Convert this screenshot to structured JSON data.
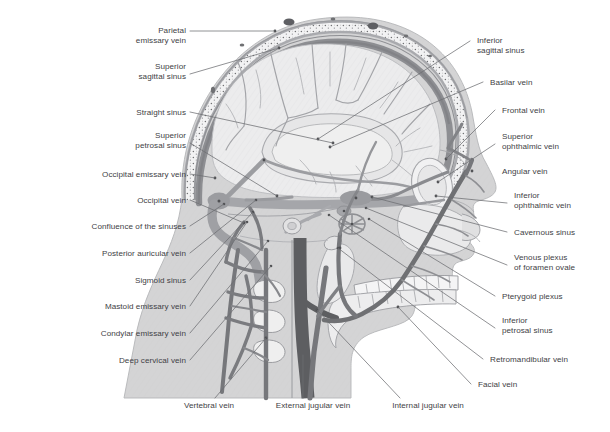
{
  "figure": {
    "view": "right lateral, midsagittal section of head and neck",
    "style": "grayscale medical atlas illustration",
    "colors": {
      "background": "#ffffff",
      "skin_silhouette": "#d2d2d2",
      "bone_light": "#efefef",
      "bone_mid": "#dcdcdc",
      "brain_fill": "#ececed",
      "vein_dark": "#6f7073",
      "vein_mid": "#9a9b9f",
      "vein_light": "#b9babd",
      "jugular_dark": "#5d5e61",
      "leader_line": "#6c6d71",
      "label_text": "#414145",
      "outline": "#8b8c90"
    }
  },
  "labels_left": [
    {
      "id": "parietal-emissary-vein",
      "text": "Parietal\nemissary vein",
      "x": 98,
      "y": 26,
      "w": 88,
      "lx": 190,
      "ly": 31,
      "tx": 275,
      "ty": 31
    },
    {
      "id": "superior-sagittal-sinus",
      "text": "Superior\nsagittal sinus",
      "x": 85,
      "y": 62,
      "w": 101,
      "lx": 190,
      "ly": 74,
      "tx": 279,
      "ty": 48
    },
    {
      "id": "straight-sinus",
      "text": "Straight sinus",
      "x": 75,
      "y": 108,
      "w": 111,
      "lx": 190,
      "ly": 112,
      "tx": 333,
      "ty": 143
    },
    {
      "id": "superior-petrosal-sinus",
      "text": "Superior\npetrosal sinus",
      "x": 85,
      "y": 131,
      "w": 101,
      "lx": 190,
      "ly": 143,
      "tx": 277,
      "ty": 196
    },
    {
      "id": "occipital-emissary-vein",
      "text": "Occipital emissary vein",
      "x": 30,
      "y": 170,
      "w": 156,
      "lx": 190,
      "ly": 174,
      "tx": 215,
      "ty": 178
    },
    {
      "id": "occipital-vein",
      "text": "Occipital vein",
      "x": 75,
      "y": 196,
      "w": 111,
      "lx": 190,
      "ly": 200,
      "tx": 244,
      "ty": 223
    },
    {
      "id": "confluence-of-the-sinuses",
      "text": "Confluence of the sinuses",
      "x": 15,
      "y": 222,
      "w": 171,
      "lx": 190,
      "ly": 226,
      "tx": 224,
      "ty": 204
    },
    {
      "id": "posterior-auricular-vein",
      "text": "Posterior auricular vein",
      "x": 28,
      "y": 249,
      "w": 158,
      "lx": 190,
      "ly": 253,
      "tx": 256,
      "ty": 200
    },
    {
      "id": "sigmoid-sinus",
      "text": "Sigmoid sinus",
      "x": 75,
      "y": 276,
      "w": 111,
      "lx": 190,
      "ly": 280,
      "tx": 253,
      "ty": 212
    },
    {
      "id": "mastoid-emissary-vein",
      "text": "Mastoid emissary vein",
      "x": 35,
      "y": 302,
      "w": 151,
      "lx": 190,
      "ly": 306,
      "tx": 247,
      "ty": 222
    },
    {
      "id": "condylar-emissary-vein",
      "text": "Condylar emissary vein",
      "x": 30,
      "y": 329,
      "w": 156,
      "lx": 190,
      "ly": 333,
      "tx": 268,
      "ty": 241
    },
    {
      "id": "deep-cervical-vein",
      "text": "Deep cervical vein",
      "x": 55,
      "y": 356,
      "w": 131,
      "lx": 190,
      "ly": 360,
      "tx": 271,
      "ty": 266
    }
  ],
  "labels_right": [
    {
      "id": "inferior-sagittal-sinus",
      "text": "Inferior\nsagittal sinus",
      "x": 477,
      "y": 36,
      "lx": 470,
      "ly": 41,
      "tx": 318,
      "ty": 139
    },
    {
      "id": "basilar-vein",
      "text": "Basilar vein",
      "x": 490,
      "y": 78,
      "lx": 483,
      "ly": 82,
      "tx": 330,
      "ty": 147
    },
    {
      "id": "frontal-vein",
      "text": "Frontal vein",
      "x": 502,
      "y": 106,
      "lx": 495,
      "ly": 110,
      "tx": 446,
      "ty": 159
    },
    {
      "id": "superior-ophthalmic-vein",
      "text": "Superior\nophthalmic vein",
      "x": 502,
      "y": 132,
      "lx": 495,
      "ly": 144,
      "tx": 438,
      "ty": 182
    },
    {
      "id": "angular-vein",
      "text": "Angular vein",
      "x": 502,
      "y": 167,
      "lx": 472,
      "ly": 171,
      "tx": 472,
      "ty": 171
    },
    {
      "id": "inferior-ophthalmic-vein",
      "text": "Inferior\nophthalmic vein",
      "x": 514,
      "y": 191,
      "lx": 507,
      "ly": 203,
      "tx": 436,
      "ty": 196
    },
    {
      "id": "cavernous-sinus",
      "text": "Cavernous sinus",
      "x": 514,
      "y": 228,
      "lx": 507,
      "ly": 232,
      "tx": 372,
      "ty": 197
    },
    {
      "id": "venous-plexus-of-foramen-ovale",
      "text": "Venous plexus\nof foramen ovale",
      "x": 514,
      "y": 253,
      "lx": 507,
      "ly": 265,
      "tx": 366,
      "ty": 208
    },
    {
      "id": "pterygoid-plexus",
      "text": "Pterygoid plexus",
      "x": 502,
      "y": 292,
      "lx": 495,
      "ly": 296,
      "tx": 369,
      "ty": 219
    },
    {
      "id": "inferior-petrosal-sinus",
      "text": "Inferior\npetrosal sinus",
      "x": 502,
      "y": 316,
      "lx": 495,
      "ly": 328,
      "tx": 329,
      "ty": 215
    },
    {
      "id": "retromandibular-vein",
      "text": "Retromandibular vein",
      "x": 490,
      "y": 355,
      "lx": 483,
      "ly": 359,
      "tx": 338,
      "ty": 248
    },
    {
      "id": "facial-vein",
      "text": "Facial vein",
      "x": 478,
      "y": 380,
      "lx": 471,
      "ly": 384,
      "tx": 398,
      "ty": 307
    }
  ],
  "labels_bottom": [
    {
      "id": "vertebral-vein",
      "text": "Vertebral vein",
      "x": 170,
      "y": 401,
      "w": 78,
      "lx": 215,
      "ly": 398,
      "tx": 266,
      "ty": 338
    },
    {
      "id": "external-jugular-vein",
      "text": "External jugular vein",
      "x": 258,
      "y": 401,
      "w": 110,
      "lx": 303,
      "ly": 398,
      "tx": 303,
      "ty": 355
    },
    {
      "id": "internal-jugular-vein",
      "text": "Internal jugular vein",
      "x": 373,
      "y": 401,
      "w": 110,
      "lx": 400,
      "ly": 398,
      "tx": 317,
      "ty": 310
    }
  ]
}
